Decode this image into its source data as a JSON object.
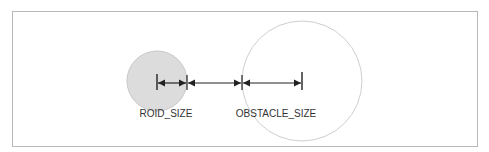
{
  "diagram": {
    "labels": {
      "roid_size": "ROID_SIZE",
      "obstacle_size": "OBSTACLE_SIZE"
    },
    "colors": {
      "frame": "#b8b8b8",
      "roid_fill": "#dcdcdc",
      "roid_stroke": "#c8c8c8",
      "obstacle_fill": "#ffffff",
      "obstacle_stroke": "#cfcfcf",
      "arrow": "#222222"
    }
  }
}
